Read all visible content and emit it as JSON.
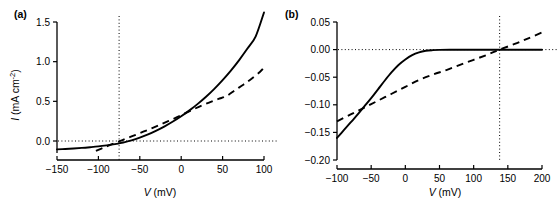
{
  "figure": {
    "panel_a_label": "(a)",
    "panel_b_label": "(b)"
  },
  "chart_data": [
    {
      "id": "panel-a",
      "type": "line",
      "title": "(a)",
      "xlabel": "V (mV)",
      "ylabel": "I (mA cm-2)",
      "xlabel_symbol": "V",
      "xlabel_unit": "(mV)",
      "ylabel_symbol": "I",
      "ylabel_unit": "(mA cm",
      "ylabel_exponent": "-2",
      "ylabel_unit_close": ")",
      "xlim": [
        -150,
        100
      ],
      "ylim": [
        -0.12,
        1.65
      ],
      "xticks": [
        -150,
        -100,
        -50,
        0,
        50,
        100
      ],
      "xticklabels": [
        "-150",
        "-100",
        "-50",
        "0",
        "50",
        "100"
      ],
      "yticks": [
        0.0,
        0.5,
        1.0,
        1.5
      ],
      "yticklabels": [
        "0.0",
        "0.5",
        "1.0",
        "1.5"
      ],
      "grid": false,
      "legend": "none",
      "annotations": [
        {
          "name": "zero-current-line",
          "type": "horizontal-dotted",
          "value": 0.0
        },
        {
          "name": "reversal-potential-line",
          "type": "vertical-dotted",
          "value": -75
        }
      ],
      "series": [
        {
          "name": "solid-curve",
          "style": "solid",
          "x": [
            -150,
            -140,
            -130,
            -120,
            -110,
            -100,
            -90,
            -80,
            -75,
            -70,
            -60,
            -50,
            -40,
            -30,
            -20,
            -10,
            0,
            10,
            20,
            30,
            40,
            50,
            60,
            70,
            80,
            90,
            100
          ],
          "y": [
            -0.105,
            -0.1,
            -0.094,
            -0.087,
            -0.078,
            -0.068,
            -0.055,
            -0.04,
            -0.03,
            -0.019,
            0.008,
            0.042,
            0.082,
            0.13,
            0.184,
            0.245,
            0.312,
            0.386,
            0.468,
            0.558,
            0.658,
            0.768,
            0.888,
            1.02,
            1.165,
            1.32,
            1.62
          ]
        },
        {
          "name": "dashed-line",
          "style": "dashed",
          "x": [
            -103,
            -95,
            -85,
            -75,
            -65,
            -55,
            -45,
            -35,
            -25,
            -15,
            -5,
            5,
            15,
            25,
            35,
            45,
            55,
            65,
            75,
            85,
            95,
            100
          ],
          "y": [
            -0.125,
            -0.09,
            -0.047,
            -0.005,
            0.037,
            0.078,
            0.12,
            0.163,
            0.207,
            0.253,
            0.3,
            0.35,
            0.4,
            0.448,
            0.49,
            0.53,
            0.568,
            0.64,
            0.71,
            0.785,
            0.87,
            0.925
          ]
        }
      ]
    },
    {
      "id": "panel-b",
      "type": "line",
      "title": "(b)",
      "xlabel": "V (mV)",
      "ylabel": "",
      "xlabel_symbol": "V",
      "xlabel_unit": "(mV)",
      "xlim": [
        -100,
        200
      ],
      "ylim": [
        -0.2,
        0.05
      ],
      "xticks": [
        -100,
        -50,
        0,
        50,
        100,
        150,
        200
      ],
      "xticklabels": [
        "-100",
        "-50",
        "0",
        "50",
        "100",
        "150",
        "200"
      ],
      "yticks": [
        -0.2,
        -0.15,
        -0.1,
        -0.05,
        0.0,
        0.05
      ],
      "yticklabels": [
        "-0.20",
        "-0.15",
        "-0.10",
        "-0.05",
        "0.00",
        "0.05"
      ],
      "grid": false,
      "legend": "none",
      "annotations": [
        {
          "name": "zero-current-line",
          "type": "horizontal-dotted",
          "value": 0.0
        },
        {
          "name": "reversal-potential-line",
          "type": "vertical-dotted",
          "value": 138
        }
      ],
      "series": [
        {
          "name": "solid-curve",
          "style": "solid",
          "x": [
            -100,
            -90,
            -80,
            -70,
            -60,
            -50,
            -40,
            -30,
            -20,
            -10,
            0,
            10,
            20,
            30,
            40,
            50,
            70,
            100,
            130,
            160,
            200
          ],
          "y": [
            -0.16,
            -0.146,
            -0.132,
            -0.118,
            -0.103,
            -0.088,
            -0.072,
            -0.056,
            -0.041,
            -0.028,
            -0.018,
            -0.01,
            -0.005,
            -0.0022,
            -0.001,
            -0.0005,
            -0.0004,
            -0.0004,
            -0.0004,
            -0.0004,
            -0.0004
          ]
        },
        {
          "name": "dashed-line",
          "style": "dashed",
          "x": [
            -100,
            -80,
            -60,
            -40,
            -20,
            0,
            20,
            40,
            60,
            80,
            100,
            120,
            138,
            160,
            180,
            200
          ],
          "y": [
            -0.13,
            -0.1175,
            -0.105,
            -0.0925,
            -0.08,
            -0.0675,
            -0.055,
            -0.0455,
            -0.037,
            -0.0277,
            -0.0185,
            -0.0092,
            0.0,
            0.0102,
            0.0205,
            0.031
          ]
        }
      ]
    }
  ]
}
